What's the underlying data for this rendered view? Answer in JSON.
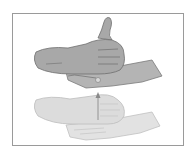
{
  "illustration": {
    "subject": "two-hand sign gesture",
    "frames": [
      {
        "name": "end-position",
        "shade": "dark",
        "description": "thumbs-up fist resting on flat palm, raised"
      },
      {
        "name": "start-position",
        "shade": "light",
        "description": "thumbs-up fist resting on flat palm, lower"
      }
    ],
    "motion": "upward arrow",
    "colors": {
      "border": "#9a9a9a",
      "dark_fill": "#a8a8a8",
      "dark_stroke": "#6e6e6e",
      "light_fill": "#dcdcdc",
      "light_stroke": "#b8b8b8",
      "arrow": "#8a8a8a",
      "background": "#ffffff"
    }
  }
}
